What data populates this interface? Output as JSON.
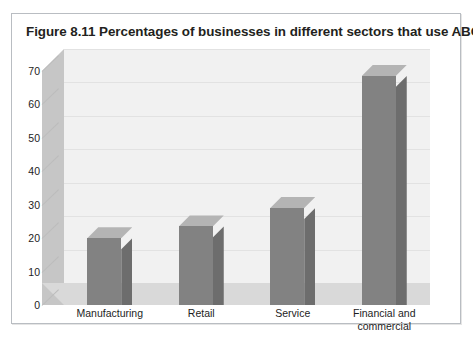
{
  "figure": {
    "title": "Figure 8.11  Percentages of businesses in different sectors that use ABC"
  },
  "chart_data": {
    "type": "bar",
    "title": "Percentages of businesses in different sectors that use ABC",
    "categories": [
      "Manufacturing",
      "Retail",
      "Service",
      "Financial and\ncommercial"
    ],
    "values": [
      20,
      23.5,
      29,
      68.5
    ],
    "series": [
      {
        "name": "% of businesses using ABC",
        "values": [
          20,
          23.5,
          29,
          68.5
        ]
      }
    ],
    "xlabel": "",
    "ylabel": "%",
    "ylim": [
      0,
      70
    ],
    "yticks": [
      0,
      10,
      20,
      30,
      40,
      50,
      60,
      70
    ],
    "ytick_labels": [
      "0",
      "10",
      "20",
      "30",
      "40",
      "50",
      "60",
      "70"
    ],
    "grid": true,
    "legend": false,
    "style": "3d-column",
    "colors": {
      "bar_front": "#828282",
      "bar_side": "#6d6d6d",
      "bar_top": "#b4b4b4",
      "plot_background": "#f1f1f1",
      "floor": "#d9d9d9",
      "wall": "#c6c6c6",
      "gridline": "#e2e2e2",
      "frame_border": "#b9bdc2",
      "text": "#231f20"
    }
  }
}
